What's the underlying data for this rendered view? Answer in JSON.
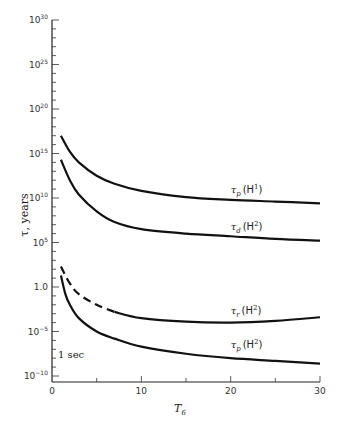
{
  "chart_data": {
    "type": "line",
    "title": "",
    "xlabel": "T",
    "xlabel_sub": "6",
    "ylabel": "τ, years",
    "xlim": [
      0,
      30
    ],
    "ylim_log10": [
      -10,
      30
    ],
    "yscale": "log",
    "grid": false,
    "x_ticks": [
      {
        "value": 0,
        "label": "0"
      },
      {
        "value": 10,
        "label": "10"
      },
      {
        "value": 20,
        "label": "20"
      },
      {
        "value": 30,
        "label": "30"
      }
    ],
    "y_ticks": [
      {
        "log10": 30,
        "base": "10",
        "exp": "30"
      },
      {
        "log10": 25,
        "base": "10",
        "exp": "25"
      },
      {
        "log10": 20,
        "base": "10",
        "exp": "20"
      },
      {
        "log10": 15,
        "base": "10",
        "exp": "15"
      },
      {
        "log10": 10,
        "base": "10",
        "exp": "10"
      },
      {
        "log10": 5,
        "base": "10",
        "exp": "5"
      },
      {
        "log10": 0,
        "base": "1.0",
        "exp": ""
      },
      {
        "log10": -5,
        "base": "10",
        "exp": "−5"
      },
      {
        "log10": -10,
        "base": "10",
        "exp": "−10"
      }
    ],
    "annotations": [
      {
        "text": "1 sec",
        "log10": -7.5
      }
    ],
    "series": [
      {
        "name": "τp(H1)",
        "label_main": "τ",
        "label_sub": "p",
        "label_species": "(H",
        "label_sup": "1",
        "label_close": ")",
        "style": "solid",
        "x": [
          1,
          2,
          3,
          5,
          7,
          10,
          15,
          20,
          25,
          30
        ],
        "log10_y": [
          17.0,
          15.2,
          14.0,
          12.5,
          11.6,
          10.8,
          10.1,
          9.8,
          9.6,
          9.4
        ]
      },
      {
        "name": "τd(H2)",
        "label_main": "τ",
        "label_sub": "d",
        "label_species": "(H",
        "label_sup": "2",
        "label_close": ")",
        "style": "solid",
        "x": [
          1,
          2,
          3,
          5,
          7,
          10,
          15,
          20,
          25,
          30
        ],
        "log10_y": [
          14.3,
          12.0,
          10.4,
          8.5,
          7.3,
          6.5,
          6.0,
          5.7,
          5.4,
          5.2
        ]
      },
      {
        "name": "τr(H2)",
        "label_main": "τ",
        "label_sub": "r",
        "label_species": "(H",
        "label_sup": "2",
        "label_close": ")",
        "style": "dashed-then-solid",
        "dash_until_x": 7,
        "x": [
          1,
          2,
          3,
          5,
          7,
          10,
          15,
          20,
          25,
          30
        ],
        "log10_y": [
          2.3,
          0.4,
          -0.8,
          -2.0,
          -2.8,
          -3.5,
          -3.9,
          -4.0,
          -3.8,
          -3.4
        ]
      },
      {
        "name": "τp(H2)",
        "label_main": "τ",
        "label_sub": "p",
        "label_species": "(H",
        "label_sup": "2",
        "label_close": ")",
        "style": "solid",
        "x": [
          1,
          1.5,
          2,
          3,
          5,
          7,
          10,
          15,
          20,
          25,
          30
        ],
        "log10_y": [
          1.3,
          -0.8,
          -2.0,
          -3.5,
          -5.0,
          -5.8,
          -6.7,
          -7.5,
          -8.0,
          -8.3,
          -8.6
        ]
      }
    ]
  }
}
